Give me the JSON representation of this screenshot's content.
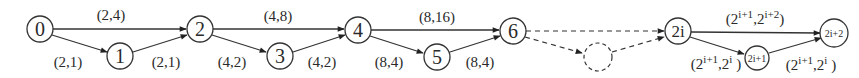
{
  "diagram": {
    "title": "",
    "nodes": [
      {
        "id": "n0",
        "label": "0"
      },
      {
        "id": "n1",
        "label": "1"
      },
      {
        "id": "n2",
        "label": "2"
      },
      {
        "id": "n3",
        "label": "3"
      },
      {
        "id": "n4",
        "label": "4"
      },
      {
        "id": "n5",
        "label": "5"
      },
      {
        "id": "n6",
        "label": "6"
      },
      {
        "id": "ndashed",
        "label": ""
      },
      {
        "id": "n2i",
        "label": "2i"
      },
      {
        "id": "n2i1",
        "label": "2i+1"
      },
      {
        "id": "n2i2",
        "label": "2i+2"
      }
    ],
    "edges": [
      {
        "from": "0",
        "to": "2",
        "label": "(2,4)"
      },
      {
        "from": "0",
        "to": "1",
        "label": "(2,1)"
      },
      {
        "from": "1",
        "to": "2",
        "label": "(2,1)"
      },
      {
        "from": "2",
        "to": "4",
        "label": "(4,8)"
      },
      {
        "from": "2",
        "to": "3",
        "label": "(4,2)"
      },
      {
        "from": "3",
        "to": "4",
        "label": "(4,2)"
      },
      {
        "from": "4",
        "to": "6",
        "label": "(8,16)"
      },
      {
        "from": "4",
        "to": "5",
        "label": "(8,4)"
      },
      {
        "from": "5",
        "to": "6",
        "label": "(8,4)"
      },
      {
        "from": "6",
        "to": "2i",
        "label": "",
        "style": "dashed"
      },
      {
        "from": "6",
        "to": "dashed",
        "label": "",
        "style": "dashed"
      },
      {
        "from": "dashed",
        "to": "2i",
        "label": "",
        "style": "dashed"
      },
      {
        "from": "2i",
        "to": "2i+2",
        "label_base1": "(2",
        "label_sup1": "i+1",
        "label_mid": ",2",
        "label_sup2": "i+2",
        "label_end": ")"
      },
      {
        "from": "2i",
        "to": "2i+1",
        "label_base1": "(2",
        "label_sup1": "i+1",
        "label_mid": ",2",
        "label_sup2": "i",
        "label_end": " )"
      },
      {
        "from": "2i+1",
        "to": "2i+2",
        "label_base1": "(2",
        "label_sup1": "i+1",
        "label_mid": ",2",
        "label_sup2": "i",
        "label_end": " )"
      }
    ]
  }
}
